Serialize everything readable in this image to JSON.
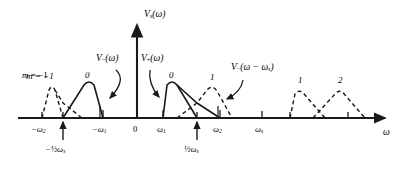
{
  "figure": {
    "type": "spectrum-diagram",
    "vertical_axis_label": "V",
    "vertical_axis_sub": "s",
    "vertical_axis_arg": "(ω)",
    "horizontal_axis_label": "ω",
    "origin_label": "0"
  },
  "axis": {
    "baseline_y": 118,
    "origin_x": 137,
    "ticks": [
      {
        "name": "tick-neg-omega2",
        "x": 42,
        "label_html": "−ω<sub>2</sub>",
        "label_x": 33,
        "label_y": 126
      },
      {
        "name": "tick-neg-half-omegas",
        "x": 63,
        "label_html": "",
        "label_x": 0,
        "label_y": 0
      },
      {
        "name": "tick-neg-omega1",
        "x": 103,
        "label_html": "−ω<sub>1</sub>",
        "label_x": 94,
        "label_y": 126
      },
      {
        "name": "tick-origin",
        "x": 137,
        "label_html": "0",
        "label_x": 134,
        "label_y": 126
      },
      {
        "name": "tick-omega1",
        "x": 163,
        "label_html": "ω<sub>1</sub>",
        "label_x": 157,
        "label_y": 126
      },
      {
        "name": "tick-half-omegas",
        "x": 197,
        "label_html": "",
        "label_x": 0,
        "label_y": 0
      },
      {
        "name": "tick-omega2",
        "x": 220,
        "label_html": "ω<sub>2</sub>",
        "label_x": 213,
        "label_y": 126
      },
      {
        "name": "tick-omegas",
        "x": 262,
        "label_html": "ω<sub>s</sub>",
        "label_x": 255,
        "label_y": 126
      },
      {
        "name": "tick-right-a",
        "x": 290,
        "label_html": "",
        "label_x": 0,
        "label_y": 0
      },
      {
        "name": "tick-right-b",
        "x": 348,
        "label_html": "",
        "label_x": 0,
        "label_y": 0
      }
    ],
    "arrow_ticks": [
      {
        "name": "arrow-neg-half-omegas",
        "x": 63,
        "label_html": "−½ω<sub>s</sub>",
        "label_x": 48,
        "label_y": 149
      },
      {
        "name": "arrow-half-omegas",
        "x": 197,
        "label_html": "½ω<sub>s</sub>",
        "label_x": 186,
        "label_y": 149
      }
    ]
  },
  "curves": [
    {
      "name": "replica-m-minus-1-dashed",
      "style": "dashed",
      "label": "m = −1",
      "label_x": 26,
      "label_y": 76,
      "peak_x": 52,
      "peak_y": 85
    },
    {
      "name": "baseband-negative-solid",
      "style": "solid",
      "label": "0",
      "label_x": 85,
      "label_y": 77,
      "peak_x": 89,
      "peak_y": 81
    },
    {
      "name": "baseband-positive-solid",
      "style": "solid",
      "label": "0",
      "label_x": 169,
      "label_y": 77,
      "peak_x": 172,
      "peak_y": 81
    },
    {
      "name": "replica-m-1-dashed-center",
      "style": "dashed",
      "label": "1",
      "label_x": 210,
      "label_y": 78,
      "peak_x": 212,
      "peak_y": 85
    },
    {
      "name": "replica-m-1-dashed-right",
      "style": "dashed",
      "label": "1",
      "label_x": 298,
      "label_y": 80,
      "peak_x": 300,
      "peak_y": 88
    },
    {
      "name": "replica-m-2-dashed-right",
      "style": "dashed",
      "label": "2",
      "label_x": 338,
      "label_y": 80,
      "peak_x": 340,
      "peak_y": 88
    }
  ],
  "callouts": [
    {
      "name": "callout-v-minus-omega",
      "label_html": "V<sub>−</sub>(ω)",
      "label_x": 96,
      "label_y": 59,
      "arrow_from": [
        112,
        70
      ],
      "arrow_to": [
        106,
        101
      ]
    },
    {
      "name": "callout-v-plus-omega",
      "label_html": "V<sub>+</sub>(ω)",
      "label_x": 142,
      "label_y": 59,
      "arrow_from": [
        150,
        70
      ],
      "arrow_to": [
        160,
        100
      ]
    },
    {
      "name": "callout-v-minus-omega-minus-omegas",
      "label_html": "V<sub>−</sub>(ω − ω<sub>s</sub>)",
      "label_x": 233,
      "label_y": 68,
      "arrow_from": [
        240,
        79
      ],
      "arrow_to": [
        222,
        100
      ]
    }
  ],
  "colors": {
    "line": "#1a1a1a",
    "background": "#ffffff",
    "text": "#000000"
  }
}
